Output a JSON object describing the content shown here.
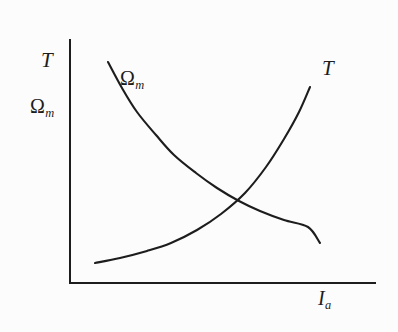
{
  "figure": {
    "background_color": "#fcfcfc",
    "ink_color": "#1d1d1d"
  },
  "axes": {
    "y_labels": [
      {
        "name": "torque",
        "text": "T"
      },
      {
        "name": "speed",
        "symbol": "Ω",
        "subscript": "m"
      }
    ],
    "x_label": {
      "name": "armature-current",
      "symbol": "I",
      "subscript": "a"
    },
    "origin": {
      "x": 70,
      "y": 283
    },
    "y_top": 40,
    "x_right": 375,
    "line_width": 2,
    "ticks": [],
    "grid": false
  },
  "curve_labels": {
    "speed": {
      "symbol": "Ω",
      "subscript": "m"
    },
    "torque": {
      "text": "T"
    }
  },
  "chart_data": {
    "type": "line",
    "title": "",
    "xlabel": "I_a",
    "ylabel": "T, Ω_m",
    "xlim": [
      0,
      1
    ],
    "ylim": [
      0,
      1
    ],
    "grid": false,
    "legend": "inline-curve-labels",
    "annotations": [
      {
        "text": "Ω_m",
        "x": 0.17,
        "y": 0.86,
        "note": "label on falling speed curve"
      },
      {
        "text": "T",
        "x": 0.84,
        "y": 0.9,
        "note": "label on rising torque curve"
      }
    ],
    "series": [
      {
        "name": "Ω_m",
        "description": "speed decreases hyperbolically with armature current",
        "shape": "decaying-hyperbola",
        "x": [
          0.124,
          0.17,
          0.22,
          0.28,
          0.34,
          0.41,
          0.48,
          0.55,
          0.62,
          0.7,
          0.78,
          0.86,
          0.94,
          1.02
        ],
        "y": [
          0.908,
          0.8,
          0.7,
          0.604,
          0.523,
          0.447,
          0.384,
          0.332,
          0.29,
          0.252,
          0.223,
          0.203,
          0.19,
          0.184
        ],
        "pixel_points": [
          [
            108,
            62
          ],
          [
            122,
            88
          ],
          [
            137,
            112
          ],
          [
            156,
            135
          ],
          [
            174,
            155
          ],
          [
            196,
            173
          ],
          [
            217,
            188
          ],
          [
            239,
            201
          ],
          [
            260,
            211
          ],
          [
            284,
            220
          ],
          [
            308,
            227
          ],
          [
            332,
            232
          ],
          [
            356,
            235
          ],
          [
            380,
            237
          ]
        ],
        "pixel_start": [
          108,
          62
        ],
        "pixel_end": [
          320,
          243
        ]
      },
      {
        "name": "T",
        "description": "torque increases steeply with armature current",
        "shape": "rising-exponential",
        "x": [
          0.105,
          0.19,
          0.28,
          0.36,
          0.45,
          0.53,
          0.61,
          0.68,
          0.74,
          0.79,
          0.83,
          0.86,
          0.885,
          0.9
        ],
        "y": [
          0.088,
          0.106,
          0.133,
          0.168,
          0.216,
          0.28,
          0.364,
          0.468,
          0.58,
          0.69,
          0.79,
          0.87,
          0.93,
          0.96
        ],
        "pixel_points": [
          [
            95,
            263
          ],
          [
            120,
            258
          ],
          [
            147,
            251
          ],
          [
            171,
            243
          ],
          [
            197,
            230
          ],
          [
            221,
            214
          ],
          [
            245,
            193
          ],
          [
            266,
            167
          ],
          [
            284,
            139
          ],
          [
            299,
            112
          ],
          [
            310,
            87
          ],
          [
            318,
            67
          ],
          [
            325,
            52
          ],
          [
            329,
            44
          ]
        ],
        "pixel_start": [
          95,
          263
        ],
        "pixel_end": [
          310,
          65
        ]
      }
    ],
    "intersection": {
      "x": 0.53,
      "y": 0.28,
      "pixel": [
        221,
        224
      ]
    }
  }
}
